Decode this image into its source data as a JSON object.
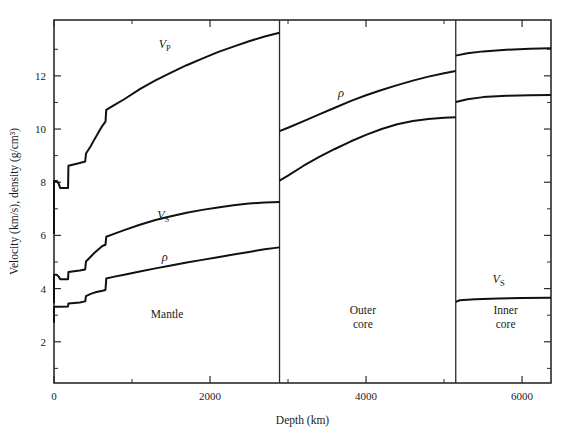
{
  "chart_data": {
    "type": "line",
    "title": "",
    "xlabel": "Depth (km)",
    "ylabel": "Velocity (km/s), density (g/cm³)",
    "xlim": [
      0,
      6371
    ],
    "ylim": [
      0.45,
      14.1
    ],
    "xticks": [
      0,
      2000,
      4000,
      6000
    ],
    "xticklabels": [
      "0",
      "2000",
      "4000",
      "6000"
    ],
    "xminor": [
      1000,
      3000,
      5000
    ],
    "yticks": [
      2,
      4,
      6,
      8,
      10,
      12
    ],
    "yticklabels": [
      "2",
      "4",
      "6",
      "8",
      "10",
      "12"
    ],
    "yminor": [
      1,
      3,
      5,
      7,
      9,
      11,
      13
    ],
    "grid": false,
    "legend_position": "inline-labels",
    "boundaries": [
      {
        "name": "core-mantle-boundary",
        "depth": 2891
      },
      {
        "name": "inner-core-boundary",
        "depth": 5150
      }
    ],
    "regions": [
      {
        "name": "mantle",
        "label": "Mantle",
        "label_lines": [
          "Mantle"
        ],
        "depth_center": 1450,
        "value_center": 2.9
      },
      {
        "name": "outer-core",
        "label": "Outer core",
        "label_lines": [
          "Outer",
          "core"
        ],
        "depth_center": 3960,
        "value_center": 3.05
      },
      {
        "name": "inner-core",
        "label": "Inner core",
        "label_lines": [
          "Inner",
          "core"
        ],
        "depth_center": 5790,
        "value_center": 3.05
      }
    ],
    "series": [
      {
        "name": "Vp",
        "label": "V_P",
        "label_main": "V",
        "label_sub": "P",
        "color": "#111111",
        "annotation_at": {
          "depth": 1420,
          "value": 13.05
        },
        "segments": [
          {
            "region": "mantle",
            "points": [
              [
                0,
                6.05
              ],
              [
                0,
                8.05
              ],
              [
                35,
                8.05
              ],
              [
                60,
                7.95
              ],
              [
                80,
                7.78
              ],
              [
                180,
                7.78
              ],
              [
                185,
                8.62
              ],
              [
                330,
                8.72
              ],
              [
                400,
                8.78
              ],
              [
                410,
                9.08
              ],
              [
                470,
                9.35
              ],
              [
                520,
                9.62
              ],
              [
                560,
                9.82
              ],
              [
                620,
                10.12
              ],
              [
                660,
                10.28
              ],
              [
                670,
                10.72
              ],
              [
                760,
                10.88
              ],
              [
                900,
                11.12
              ],
              [
                1100,
                11.5
              ],
              [
                1300,
                11.83
              ],
              [
                1500,
                12.12
              ],
              [
                1700,
                12.4
              ],
              [
                1900,
                12.65
              ],
              [
                2100,
                12.89
              ],
              [
                2300,
                13.1
              ],
              [
                2500,
                13.3
              ],
              [
                2700,
                13.48
              ],
              [
                2891,
                13.62
              ]
            ]
          },
          {
            "region": "outer-core",
            "points": [
              [
                2891,
                8.06
              ],
              [
                3000,
                8.25
              ],
              [
                3200,
                8.62
              ],
              [
                3400,
                8.95
              ],
              [
                3600,
                9.25
              ],
              [
                3800,
                9.53
              ],
              [
                4000,
                9.78
              ],
              [
                4200,
                10.0
              ],
              [
                4400,
                10.18
              ],
              [
                4600,
                10.3
              ],
              [
                4800,
                10.38
              ],
              [
                5000,
                10.42
              ],
              [
                5150,
                10.44
              ]
            ]
          },
          {
            "region": "inner-core",
            "points": [
              [
                5150,
                11.02
              ],
              [
                5300,
                11.12
              ],
              [
                5500,
                11.2
              ],
              [
                5800,
                11.25
              ],
              [
                6100,
                11.27
              ],
              [
                6371,
                11.28
              ]
            ]
          }
        ]
      },
      {
        "name": "Vs",
        "label": "V_S",
        "label_main": "V",
        "label_sub": "S",
        "color": "#111111",
        "annotation_at": {
          "depth": 1400,
          "value": 6.62
        },
        "segments": [
          {
            "region": "mantle",
            "points": [
              [
                0,
                3.45
              ],
              [
                0,
                4.52
              ],
              [
                35,
                4.52
              ],
              [
                60,
                4.45
              ],
              [
                80,
                4.35
              ],
              [
                180,
                4.35
              ],
              [
                185,
                4.62
              ],
              [
                330,
                4.68
              ],
              [
                400,
                4.72
              ],
              [
                410,
                5.02
              ],
              [
                470,
                5.2
              ],
              [
                520,
                5.35
              ],
              [
                560,
                5.45
              ],
              [
                620,
                5.6
              ],
              [
                660,
                5.65
              ],
              [
                670,
                5.95
              ],
              [
                760,
                6.05
              ],
              [
                900,
                6.2
              ],
              [
                1100,
                6.4
              ],
              [
                1300,
                6.58
              ],
              [
                1500,
                6.72
              ],
              [
                1700,
                6.85
              ],
              [
                1900,
                6.96
              ],
              [
                2100,
                7.05
              ],
              [
                2300,
                7.13
              ],
              [
                2500,
                7.2
              ],
              [
                2700,
                7.24
              ],
              [
                2891,
                7.26
              ]
            ]
          },
          {
            "region": "inner-core",
            "points": [
              [
                5150,
                3.5
              ],
              [
                5200,
                3.56
              ],
              [
                5400,
                3.6
              ],
              [
                5700,
                3.63
              ],
              [
                6000,
                3.65
              ],
              [
                6371,
                3.66
              ]
            ]
          }
        ],
        "annotation2_at": {
          "depth": 5700,
          "value": 4.22
        }
      },
      {
        "name": "rho",
        "label": "ρ",
        "color": "#111111",
        "annotation_at": {
          "depth": 1420,
          "value": 5.02
        },
        "annotation2_at": {
          "depth": 3680,
          "value": 11.22
        },
        "segments": [
          {
            "region": "mantle",
            "points": [
              [
                0,
                2.72
              ],
              [
                0,
                3.32
              ],
              [
                35,
                3.32
              ],
              [
                60,
                3.32
              ],
              [
                80,
                3.32
              ],
              [
                180,
                3.33
              ],
              [
                185,
                3.44
              ],
              [
                330,
                3.48
              ],
              [
                400,
                3.52
              ],
              [
                410,
                3.72
              ],
              [
                470,
                3.8
              ],
              [
                520,
                3.85
              ],
              [
                560,
                3.88
              ],
              [
                620,
                3.92
              ],
              [
                660,
                3.95
              ],
              [
                670,
                4.38
              ],
              [
                760,
                4.44
              ],
              [
                900,
                4.52
              ],
              [
                1100,
                4.64
              ],
              [
                1300,
                4.76
              ],
              [
                1500,
                4.87
              ],
              [
                1700,
                4.98
              ],
              [
                1900,
                5.08
              ],
              [
                2100,
                5.18
              ],
              [
                2300,
                5.28
              ],
              [
                2500,
                5.38
              ],
              [
                2700,
                5.48
              ],
              [
                2891,
                5.55
              ]
            ]
          },
          {
            "region": "outer-core",
            "points": [
              [
                2891,
                9.92
              ],
              [
                3000,
                10.05
              ],
              [
                3200,
                10.3
              ],
              [
                3400,
                10.55
              ],
              [
                3600,
                10.8
              ],
              [
                3800,
                11.05
              ],
              [
                4000,
                11.27
              ],
              [
                4200,
                11.47
              ],
              [
                4400,
                11.65
              ],
              [
                4600,
                11.82
              ],
              [
                4800,
                11.97
              ],
              [
                5000,
                12.1
              ],
              [
                5150,
                12.18
              ]
            ]
          },
          {
            "region": "inner-core",
            "points": [
              [
                5150,
                12.76
              ],
              [
                5300,
                12.85
              ],
              [
                5500,
                12.92
              ],
              [
                5800,
                12.98
              ],
              [
                6100,
                13.02
              ],
              [
                6371,
                13.04
              ]
            ]
          }
        ]
      }
    ]
  },
  "figure": {
    "plot_left": 54,
    "plot_right": 551,
    "plot_top": 20,
    "plot_bottom": 383
  }
}
